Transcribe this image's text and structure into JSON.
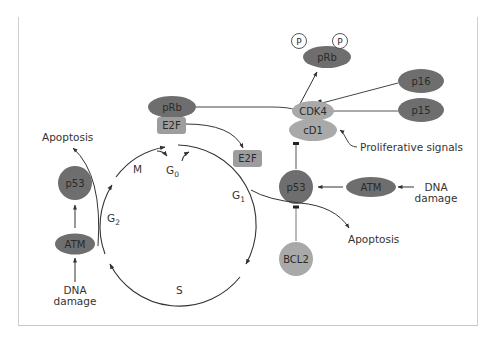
{
  "diagram": {
    "title": "",
    "colors": {
      "dark_node": "#6e6e6e",
      "light_node": "#a9a9a9",
      "rect_node": "#9d9d9d",
      "line": "#333333",
      "frame": "#c8c8c8",
      "background": "#ffffff"
    },
    "nodes": {
      "prb_phosphorylated": "pRb",
      "phospho_left": "P",
      "phospho_right": "P",
      "p16": "p16",
      "p15": "p15",
      "cdk4": "CDK4",
      "cd1": "cD1",
      "prb_bound": "pRb",
      "e2f_bound": "E2F",
      "e2f_free": "E2F",
      "p53_right": "p53",
      "atm_right": "ATM",
      "bcl2": "BCL2",
      "p53_left": "p53",
      "atm_left": "ATM"
    },
    "labels": {
      "proliferative_signals": "Proliferative signals",
      "dna_damage_right_line1": "DNA",
      "dna_damage_right_line2": "damage",
      "dna_damage_left_line1": "DNA",
      "dna_damage_left_line2": "damage",
      "apoptosis_right": "Apoptosis",
      "apoptosis_left": "Apoptosis"
    },
    "cell_cycle_phases": [
      {
        "id": "m",
        "label": "M",
        "sub": ""
      },
      {
        "id": "g0",
        "label": "G",
        "sub": "0"
      },
      {
        "id": "g1",
        "label": "G",
        "sub": "1"
      },
      {
        "id": "s",
        "label": "S",
        "sub": ""
      },
      {
        "id": "g2",
        "label": "G",
        "sub": "2"
      }
    ],
    "edges": [
      {
        "from": "prb_bound",
        "to": "cdk4",
        "type": "line"
      },
      {
        "from": "cdk4",
        "to": "prb_phosphorylated",
        "type": "activation"
      },
      {
        "from": "p16",
        "to": "cdk4",
        "type": "inhibition"
      },
      {
        "from": "p15",
        "to": "cdk4",
        "type": "inhibition"
      },
      {
        "from": "proliferative_signals",
        "to": "cd1",
        "type": "activation"
      },
      {
        "from": "p53_right",
        "to": "cd1",
        "type": "inhibition"
      },
      {
        "from": "atm_right",
        "to": "p53_right",
        "type": "activation"
      },
      {
        "from": "dna_damage_right",
        "to": "atm_right",
        "type": "activation"
      },
      {
        "from": "bcl2",
        "to": "p53_right",
        "type": "inhibition"
      },
      {
        "from": "p53_right",
        "to": "apoptosis_right",
        "type": "activation"
      },
      {
        "from": "e2f_bound",
        "to": "e2f_free",
        "type": "activation"
      },
      {
        "from": "dna_damage_left",
        "to": "atm_left",
        "type": "activation"
      },
      {
        "from": "atm_left",
        "to": "p53_left",
        "type": "activation"
      },
      {
        "from": "g2",
        "to": "apoptosis_left",
        "type": "activation"
      }
    ]
  }
}
